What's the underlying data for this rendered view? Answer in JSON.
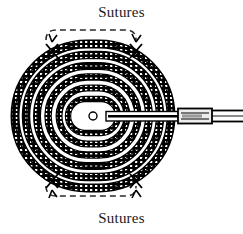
{
  "figure": {
    "type": "technical-diagram",
    "background_color": "#ffffff",
    "ink_color": "#000000",
    "width": 243,
    "height": 234
  },
  "labels": {
    "top": "Sutures",
    "bottom": "Sutures"
  },
  "brackets": {
    "top": {
      "name": "dashed-bracket-top",
      "x_start": 45,
      "x_end": 137,
      "y": 30,
      "style": "dashed",
      "end_direction": "down"
    },
    "bottom": {
      "name": "dashed-bracket-bottom",
      "x_start": 45,
      "x_end": 137,
      "y": 196,
      "style": "dashed",
      "end_direction": "up"
    }
  },
  "coil": {
    "name": "spiral-coil",
    "shape": "stadium",
    "turns": 6,
    "center_x": 93,
    "center_y": 116,
    "outer_rx": 80,
    "outer_ry": 74,
    "band_texture": "hatched",
    "band_color": "#000000",
    "hatch_color": "#ffffff"
  },
  "center_marker": {
    "name": "center-dot",
    "cx": 93,
    "cy": 116,
    "r": 4,
    "fill": "#ffffff",
    "stroke": "#000000"
  },
  "suture_knots": [
    {
      "name": "suture-knot-top-left",
      "x": 52,
      "y": 52
    },
    {
      "name": "suture-knot-top-right",
      "x": 136,
      "y": 52
    },
    {
      "name": "suture-knot-bottom-left",
      "x": 52,
      "y": 178
    },
    {
      "name": "suture-knot-bottom-right",
      "x": 136,
      "y": 178
    }
  ],
  "lead_wire": {
    "name": "lead-wire",
    "y": 116,
    "start_x": 108,
    "end_x": 243,
    "connector": {
      "name": "crimp-connector",
      "x_start": 178,
      "x_end": 212,
      "height": 13,
      "fill": "#e8e8e8",
      "stroke": "#000000"
    }
  }
}
